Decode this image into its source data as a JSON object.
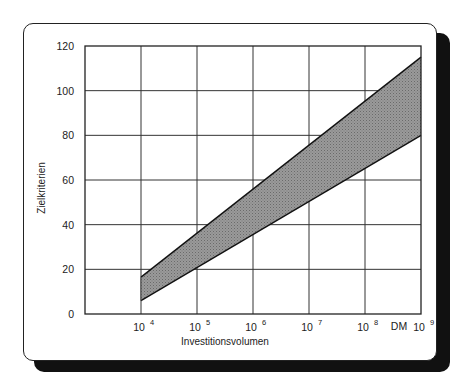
{
  "chart_data": {
    "type": "area",
    "title": "",
    "xlabel": "Investitionsvolumen",
    "ylabel": "Zielkriterien",
    "x_scale": "log10",
    "x_unit_label": "DM",
    "xlim_exponent": [
      3,
      9
    ],
    "ylim": [
      0,
      120
    ],
    "grid": true,
    "y_ticks": [
      0,
      20,
      40,
      60,
      80,
      100,
      120
    ],
    "x_ticks": [
      {
        "exponent": 4,
        "base": "10",
        "sup": "4"
      },
      {
        "exponent": 5,
        "base": "10",
        "sup": "5"
      },
      {
        "exponent": 6,
        "base": "10",
        "sup": "6"
      },
      {
        "exponent": 7,
        "base": "10",
        "sup": "7"
      },
      {
        "exponent": 8,
        "base": "10",
        "sup": "8"
      },
      {
        "exponent": 9,
        "base": "10",
        "sup": "9"
      }
    ],
    "band": {
      "name": "Zielkriterien-Bereich",
      "x_exponent": [
        4,
        9
      ],
      "upper": [
        16.5,
        115
      ],
      "lower": [
        6,
        80
      ],
      "fill": "#8a8a8a",
      "stroke": "#111111"
    }
  }
}
